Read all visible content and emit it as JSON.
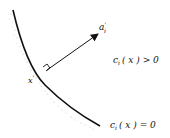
{
  "diagram": {
    "normal_vector_label": "a",
    "normal_vector_sup": "'",
    "normal_vector_sub": "i",
    "point_label": "x",
    "point_sup": "'",
    "region_label": "c",
    "region_sub": "i",
    "region_arg": "( x ) > 0",
    "boundary_label": "c",
    "boundary_sub": "i",
    "boundary_arg": "( x ) = 0"
  }
}
